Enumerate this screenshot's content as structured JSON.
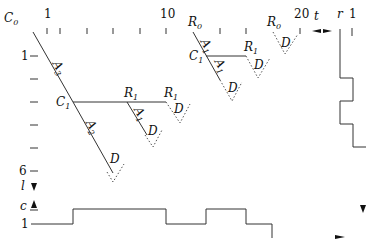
{
  "axes": {
    "top_labels": [
      {
        "text": "1"
      },
      {
        "text": "10"
      },
      {
        "text": "20"
      },
      {
        "text": "t"
      }
    ],
    "right_labels": [
      {
        "text": "r"
      },
      {
        "text": "1"
      }
    ],
    "left_labels": [
      {
        "text": "1"
      },
      {
        "text": "6"
      },
      {
        "text": "l"
      },
      {
        "text": "c"
      },
      {
        "text": "1"
      }
    ]
  },
  "nodes": {
    "C0": {
      "base": "C",
      "sub": "0"
    },
    "C1_left": {
      "base": "C",
      "sub": "1"
    },
    "C1_right": {
      "base": "C",
      "sub": "1"
    },
    "R0_a": {
      "base": "R",
      "sub": "0"
    },
    "R0_b": {
      "base": "R",
      "sub": "0"
    },
    "R1_a": {
      "base": "R",
      "sub": "1"
    },
    "R1_b": {
      "base": "R",
      "sub": "1"
    },
    "R1_c": {
      "base": "R",
      "sub": "1"
    }
  },
  "edges": {
    "A3": {
      "base": "A",
      "sub": "3"
    },
    "A2": {
      "base": "A",
      "sub": "2"
    },
    "A1_a": {
      "base": "A",
      "sub": "1"
    },
    "A1_b": {
      "base": "A",
      "sub": "1"
    },
    "A1_c": {
      "base": "A",
      "sub": "1"
    },
    "D": "D"
  },
  "step_plots": {
    "bottom_levels": [
      1,
      2,
      1,
      2,
      1,
      0
    ],
    "right_levels": [
      0,
      1,
      0,
      1,
      0
    ]
  }
}
